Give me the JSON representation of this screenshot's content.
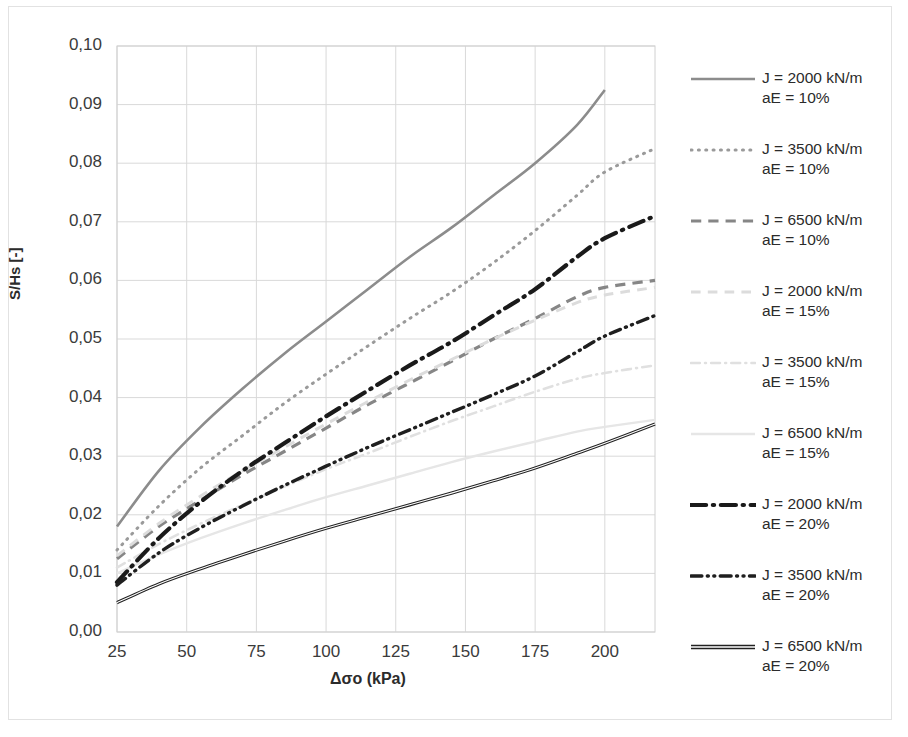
{
  "chart_data": {
    "type": "line",
    "title": "",
    "xlabel": "Δσo (kPa)",
    "ylabel": "S/Hs [-]",
    "xlim": [
      25,
      218
    ],
    "ylim": [
      0.0,
      0.1
    ],
    "xticks": [
      25,
      50,
      75,
      100,
      125,
      150,
      175,
      200
    ],
    "xtick_labels": [
      "25",
      "50",
      "75",
      "100",
      "125",
      "150",
      "175",
      "200"
    ],
    "yticks": [
      0.0,
      0.01,
      0.02,
      0.03,
      0.04,
      0.05,
      0.06,
      0.07,
      0.08,
      0.09,
      0.1
    ],
    "ytick_labels": [
      "0,00",
      "0,01",
      "0,02",
      "0,03",
      "0,04",
      "0,05",
      "0,06",
      "0,07",
      "0,08",
      "0,09",
      "0,10"
    ],
    "grid": true,
    "grid_color": "#d9d9d9",
    "legend_position": "right",
    "decimal_separator": ",",
    "x": [
      25,
      40,
      55,
      70,
      85,
      100,
      115,
      130,
      145,
      160,
      175,
      190,
      200,
      218
    ],
    "series": [
      {
        "name": "J = 2000 kN/m\naE = 10%",
        "label_line1": "J = 2000 kN/m",
        "label_line2": "aE = 10%",
        "style": "solid",
        "color": "#8c8c8c",
        "width": 2.6,
        "x_end": 200,
        "values": [
          0.018,
          0.0275,
          0.035,
          0.0415,
          0.0475,
          0.053,
          0.0585,
          0.064,
          0.069,
          0.0745,
          0.08,
          0.0865,
          0.0925,
          0.0925
        ]
      },
      {
        "name": "J = 3500 kN/m\naE = 10%",
        "label_line1": "J = 3500 kN/m",
        "label_line2": "aE = 10%",
        "style": "dotted",
        "color": "#9a9a9a",
        "width": 3.0,
        "x_end": 218,
        "values": [
          0.014,
          0.0215,
          0.028,
          0.0335,
          0.039,
          0.044,
          0.0488,
          0.0535,
          0.058,
          0.063,
          0.0685,
          0.0745,
          0.0785,
          0.0825
        ]
      },
      {
        "name": "J = 6500 kN/m\naE = 10%",
        "label_line1": "J = 6500 kN/m",
        "label_line2": "aE = 10%",
        "style": "dashed",
        "color": "#868686",
        "width": 3.2,
        "x_end": 218,
        "values": [
          0.0125,
          0.018,
          0.0225,
          0.0268,
          0.0308,
          0.0348,
          0.0388,
          0.0425,
          0.0462,
          0.05,
          0.0535,
          0.0572,
          0.0588,
          0.06
        ]
      },
      {
        "name": "J = 2000 kN/m\naE = 15%",
        "label_line1": "J = 2000 kN/m",
        "label_line2": "aE = 15%",
        "style": "dashed-light",
        "color": "#dcdcdc",
        "width": 3.0,
        "x_end": 218,
        "values": [
          0.013,
          0.0185,
          0.0232,
          0.0275,
          0.0315,
          0.0355,
          0.0393,
          0.043,
          0.0465,
          0.05,
          0.0532,
          0.0562,
          0.0575,
          0.0588
        ]
      },
      {
        "name": "J = 3500 kN/m\naE = 15%",
        "label_line1": "J = 3500 kN/m",
        "label_line2": "aE = 15%",
        "style": "dashdot-light",
        "color": "#e0e0e0",
        "width": 2.6,
        "x_end": 218,
        "values": [
          0.011,
          0.015,
          0.0185,
          0.0217,
          0.0248,
          0.0278,
          0.0305,
          0.0333,
          0.036,
          0.0385,
          0.041,
          0.0432,
          0.0442,
          0.0455
        ]
      },
      {
        "name": "J = 6500 kN/m\naE = 15%",
        "label_line1": "J = 6500 kN/m",
        "label_line2": "aE = 15%",
        "style": "solid-light",
        "color": "#e6e6e6",
        "width": 2.4,
        "x_end": 218,
        "values": [
          0.01,
          0.0132,
          0.016,
          0.0185,
          0.0208,
          0.023,
          0.025,
          0.027,
          0.029,
          0.0308,
          0.0325,
          0.0342,
          0.035,
          0.0362
        ]
      },
      {
        "name": "J = 2000 kN/m\naE = 20%",
        "label_line1": "J = 2000 kN/m",
        "label_line2": "aE = 20%",
        "style": "dashdot-bold",
        "color": "#1a1a1a",
        "width": 4.2,
        "x_end": 218,
        "values": [
          0.0085,
          0.016,
          0.0222,
          0.0275,
          0.0322,
          0.0368,
          0.0412,
          0.0455,
          0.0495,
          0.054,
          0.0585,
          0.064,
          0.0672,
          0.071
        ]
      },
      {
        "name": "J = 3500 kN/m\naE = 20%",
        "label_line1": "J = 3500 kN/m",
        "label_line2": "aE = 20%",
        "style": "dashdotdot-bold",
        "color": "#1f1f1f",
        "width": 3.4,
        "x_end": 218,
        "values": [
          0.008,
          0.0135,
          0.0178,
          0.0215,
          0.025,
          0.0283,
          0.0315,
          0.0345,
          0.0375,
          0.0405,
          0.0437,
          0.0478,
          0.0505,
          0.054
        ]
      },
      {
        "name": "J = 6500 kN/m\naE = 20%",
        "label_line1": "J = 6500 kN/m",
        "label_line2": "aE = 20%",
        "style": "double-solid",
        "color": "#222222",
        "width": 3.2,
        "x_end": 218,
        "values": [
          0.005,
          0.0082,
          0.0108,
          0.0132,
          0.0155,
          0.0177,
          0.0197,
          0.0217,
          0.0237,
          0.0258,
          0.028,
          0.0305,
          0.0322,
          0.0355
        ]
      }
    ]
  },
  "axes": {
    "y_title": "S/Hs [-]",
    "x_title": "Δσo (kPa)"
  },
  "legend": {
    "entries": [
      {
        "line1": "J = 2000 kN/m",
        "line2": "aE = 10%"
      },
      {
        "line1": "J = 3500 kN/m",
        "line2": "aE = 10%"
      },
      {
        "line1": "J = 6500 kN/m",
        "line2": "aE = 10%"
      },
      {
        "line1": "J = 2000 kN/m",
        "line2": "aE = 15%"
      },
      {
        "line1": "J = 3500 kN/m",
        "line2": "aE = 15%"
      },
      {
        "line1": "J = 6500 kN/m",
        "line2": "aE = 15%"
      },
      {
        "line1": "J = 2000 kN/m",
        "line2": "aE = 20%"
      },
      {
        "line1": "J = 3500 kN/m",
        "line2": "aE = 20%"
      },
      {
        "line1": "J = 6500 kN/m",
        "line2": "aE = 20%"
      }
    ]
  }
}
